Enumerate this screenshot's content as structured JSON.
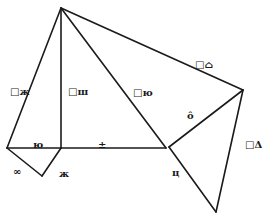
{
  "diagram": {
    "type": "geometry",
    "stroke_color": "#1a1a1a",
    "background": "#ffffff",
    "vertices": {
      "A": [
        61,
        8
      ],
      "B": [
        7,
        148
      ],
      "D": [
        61,
        148
      ],
      "E": [
        42,
        176
      ],
      "C": [
        166,
        148
      ],
      "H": [
        169,
        147
      ],
      "F": [
        243,
        90
      ],
      "G": [
        216,
        212
      ]
    },
    "segments": [
      [
        "A",
        "B"
      ],
      [
        "A",
        "D"
      ],
      [
        "A",
        "C"
      ],
      [
        "A",
        "F"
      ],
      [
        "B",
        "D"
      ],
      [
        "D",
        "C"
      ],
      [
        "B",
        "E"
      ],
      [
        "E",
        "D"
      ],
      [
        "H",
        "F"
      ],
      [
        "F",
        "G"
      ],
      [
        "H",
        "G"
      ]
    ],
    "labels": [
      {
        "id": "label-ab",
        "text": "□ж",
        "x": 10,
        "y": 95
      },
      {
        "id": "label-ad",
        "text": "□ш",
        "x": 68,
        "y": 95
      },
      {
        "id": "label-ac",
        "text": "□ю",
        "x": 133,
        "y": 96
      },
      {
        "id": "label-af",
        "text": "□⌂",
        "x": 195,
        "y": 68
      },
      {
        "id": "label-hf",
        "text": "ô",
        "x": 187,
        "y": 119
      },
      {
        "id": "label-fg",
        "text": "□Δ",
        "x": 245,
        "y": 148
      },
      {
        "id": "label-bd",
        "text": "ю",
        "x": 33,
        "y": 148
      },
      {
        "id": "label-dc",
        "text": "±",
        "x": 98,
        "y": 148
      },
      {
        "id": "label-be",
        "text": "∞",
        "x": 13,
        "y": 175
      },
      {
        "id": "label-ed",
        "text": "ж",
        "x": 59,
        "y": 177
      },
      {
        "id": "label-hg",
        "text": "ц",
        "x": 172,
        "y": 176
      }
    ]
  }
}
